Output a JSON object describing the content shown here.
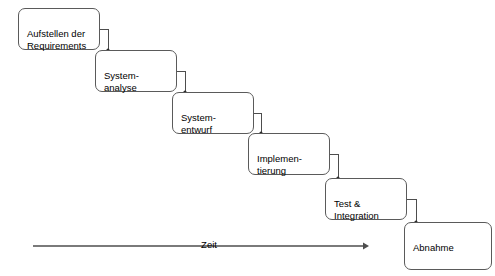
{
  "diagram": {
    "phases": [
      {
        "label": "Aufstellen der\nRequirements",
        "x": 18,
        "y": 8,
        "w": 82,
        "h": 42
      },
      {
        "label": "System-\nanalyse",
        "x": 95,
        "y": 50,
        "w": 82,
        "h": 42
      },
      {
        "label": "System-\nentwurf",
        "x": 172,
        "y": 92,
        "w": 82,
        "h": 42
      },
      {
        "label": "Implemen-\ntierung",
        "x": 248,
        "y": 133,
        "w": 82,
        "h": 42
      },
      {
        "label": "Test &\nIntegration",
        "x": 325,
        "y": 178,
        "w": 82,
        "h": 42
      },
      {
        "label": "Abnahme",
        "x": 404,
        "y": 222,
        "w": 88,
        "h": 48
      }
    ],
    "connectors": [
      {
        "from": "Aufstellen der Requirements",
        "to": "System-analyse"
      },
      {
        "from": "System-analyse",
        "to": "System-entwurf"
      },
      {
        "from": "System-entwurf",
        "to": "Implemen-tierung"
      },
      {
        "from": "Implemen-tierung",
        "to": "Test & Integration"
      },
      {
        "from": "Test & Integration",
        "to": "Abnahme"
      }
    ],
    "time_axis": {
      "label": "Zeit",
      "x_start": 33,
      "x_end": 366,
      "y": 246,
      "label_x": 209,
      "label_y": 239
    },
    "colors": {
      "box_border": "#5a5a5a",
      "box_fill": "#ffffff",
      "connector": "#4d4d4d",
      "axis": "#7a7a7a",
      "text": "#000000",
      "background": "#ffffff"
    }
  }
}
